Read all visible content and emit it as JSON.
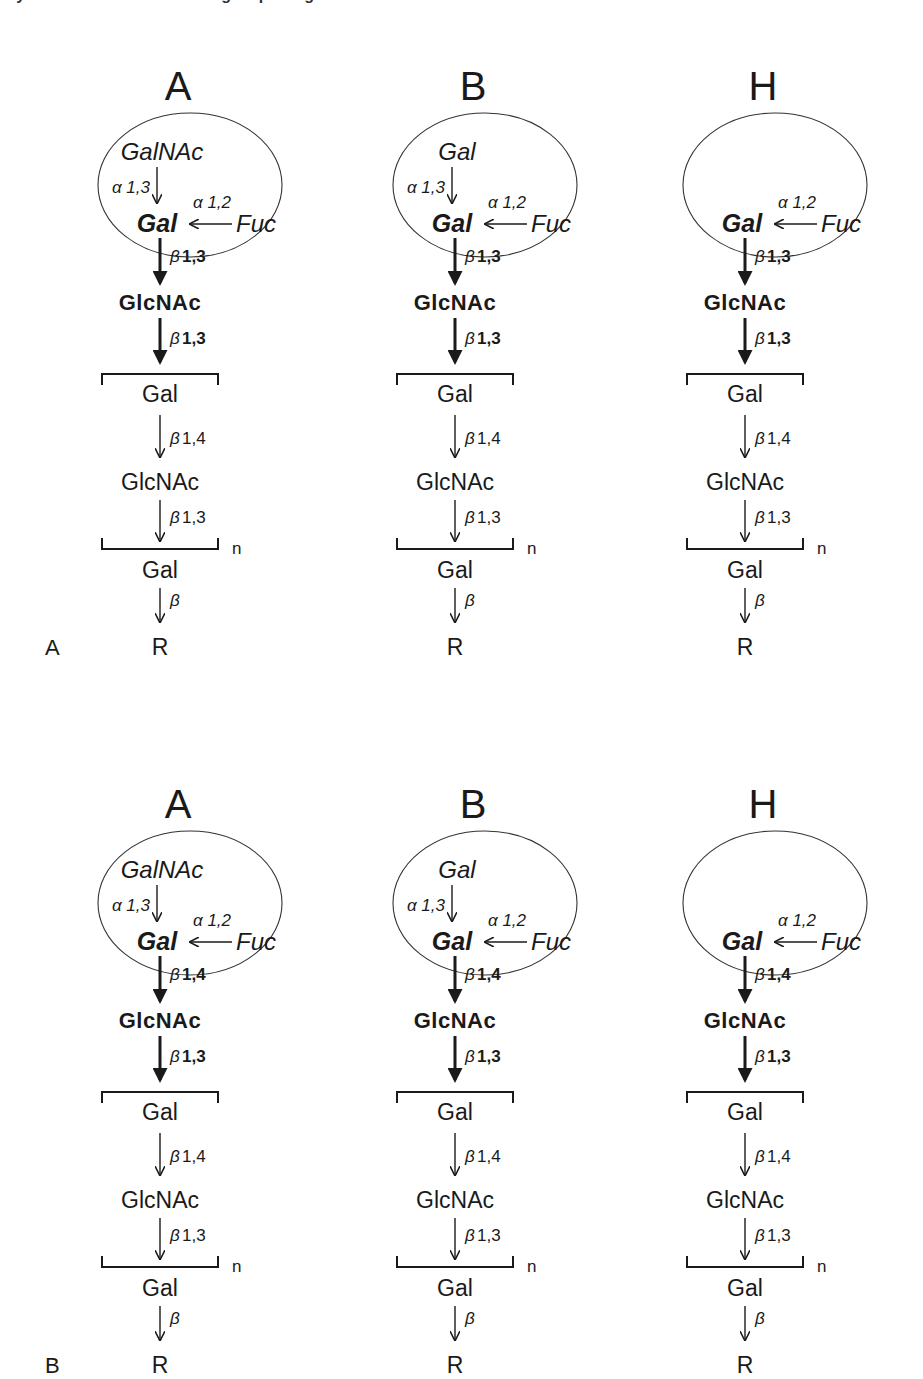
{
  "figure": {
    "top_caption_fragment": "ary structures of the blood group antigens",
    "panels": [
      {
        "panel_label": "A",
        "inner_linkage": "β 1,3",
        "columns": [
          {
            "header": "A",
            "terminal": "GalNAc",
            "terminal_linkage": "α 1,3",
            "fuc_linkage": "α 1,2"
          },
          {
            "header": "B",
            "terminal": "Gal",
            "terminal_linkage": "α 1,3",
            "fuc_linkage": "α 1,2"
          },
          {
            "header": "H",
            "terminal": "",
            "terminal_linkage": "",
            "fuc_linkage": "α 1,2"
          }
        ]
      },
      {
        "panel_label": "B",
        "inner_linkage": "β 1,4",
        "columns": [
          {
            "header": "A",
            "terminal": "GalNAc",
            "terminal_linkage": "α 1,3",
            "fuc_linkage": "α 1,2"
          },
          {
            "header": "B",
            "terminal": "Gal",
            "terminal_linkage": "α 1,3",
            "fuc_linkage": "α 1,2"
          },
          {
            "header": "H",
            "terminal": "",
            "terminal_linkage": "",
            "fuc_linkage": "α 1,2"
          }
        ]
      }
    ],
    "common": {
      "core_sugar": "Gal",
      "fucose": "Fuc",
      "glcnac_bold": "GlcNAc",
      "glcnac_to_repeat_linkage": "β 1,3",
      "repeat_gal": "Gal",
      "repeat_gal_linkage": "β 1,4",
      "repeat_glcnac": "GlcNAc",
      "repeat_glcnac_linkage": "β 1,3",
      "repeat_count": "n",
      "reducing_gal": "Gal",
      "reducing_linkage": "β",
      "aglycone": "R"
    }
  }
}
